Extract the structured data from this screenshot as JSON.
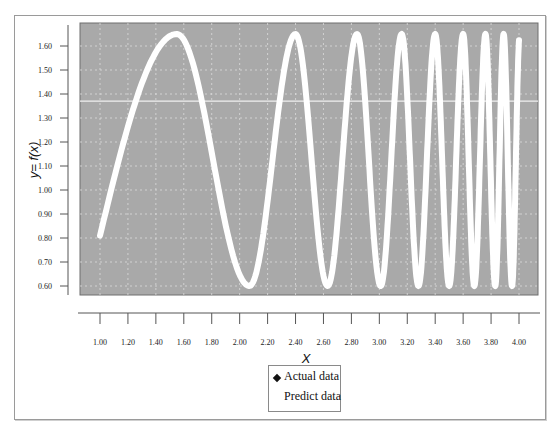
{
  "chart_data": {
    "type": "line",
    "title": "",
    "xlabel": "X",
    "ylabel": "y= f(x)",
    "xlim": [
      1.0,
      4.0
    ],
    "ylim": [
      0.6,
      1.65
    ],
    "x_ticks": [
      "1.00",
      "1.20",
      "1.40",
      "1.60",
      "1.80",
      "2.00",
      "2.20",
      "2.40",
      "2.60",
      "2.80",
      "3.00",
      "3.20",
      "3.40",
      "3.60",
      "3.80",
      "4.00"
    ],
    "y_ticks": [
      "1.60",
      "1.50",
      "1.40",
      "1.30",
      "1.20",
      "1.10",
      "1.00",
      "0.90",
      "0.80",
      "0.70",
      "0.60"
    ],
    "grid": true,
    "legend_position": "bottom-center",
    "background": "#a9a9a9",
    "line_color": "#ffffff",
    "reference_line_y": 1.37,
    "series": [
      {
        "name": "Actual data",
        "marker": "diamond",
        "color": "#111111"
      },
      {
        "name": "Predict data",
        "marker": "none",
        "color": "#ffffff",
        "description": "chirp-like oscillation between ~0.60 and ~1.65 with increasing frequency",
        "peaks_x": [
          1.55,
          2.4,
          2.84,
          3.16,
          3.4,
          3.6,
          3.76,
          3.89
        ],
        "troughs_x": [
          2.07,
          2.63,
          3.01,
          3.28,
          3.5,
          3.68,
          3.83,
          3.95
        ],
        "start": {
          "x": 1.0,
          "y": 0.81
        },
        "end": {
          "x": 4.0,
          "y": 1.58
        }
      }
    ]
  },
  "legend": {
    "items": [
      {
        "label": "Actual data"
      },
      {
        "label": "Predict data"
      }
    ]
  },
  "axes": {
    "x_title": "X",
    "y_title": "y= f(x)"
  }
}
